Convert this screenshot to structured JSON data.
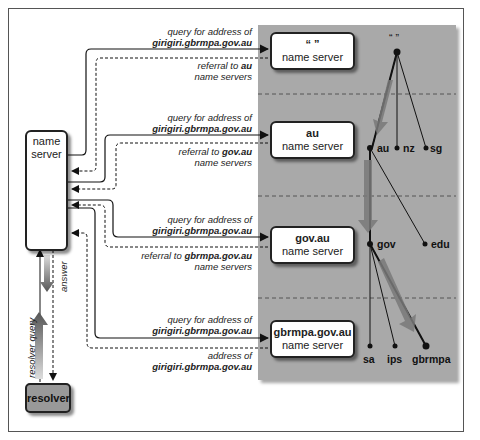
{
  "diagram": {
    "local_server": {
      "line1": "name",
      "line2": "server"
    },
    "resolver": {
      "label": "resolver"
    },
    "vertical_labels": {
      "answer": "answer",
      "resolver_query": "resolver query"
    },
    "servers": [
      {
        "name": "“ ”",
        "sub": "name server"
      },
      {
        "name": "au",
        "sub": "name server"
      },
      {
        "name": "gov.au",
        "sub": "name server"
      },
      {
        "name": "gbrmpa.gov.au",
        "sub": "name server"
      }
    ],
    "exchanges": [
      {
        "query_prefix": "query for address of",
        "query_target": "girigiri.gbrmpa.gov.au",
        "reply_prefix": "referral to",
        "reply_target": "au",
        "reply_suffix": "name servers"
      },
      {
        "query_prefix": "query for address of",
        "query_target": "girigiri.gbrmpa.gov.au",
        "reply_prefix": "referral to",
        "reply_target": "gov.au",
        "reply_suffix": "name servers"
      },
      {
        "query_prefix": "query for address of",
        "query_target": "girigiri.gbrmpa.gov.au",
        "reply_prefix": "referral to",
        "reply_target": "gbrmpa.gov.au",
        "reply_suffix": "name servers"
      },
      {
        "query_prefix": "query for address of",
        "query_target": "girigiri.gbrmpa.gov.au",
        "reply_prefix": "address of",
        "reply_target": "girigiri.gbrmpa.gov.au",
        "reply_suffix": ""
      }
    ],
    "tree": {
      "root": "“ ”",
      "level1": [
        "au",
        "nz",
        "sg"
      ],
      "level2": [
        "gov",
        "edu"
      ],
      "level3": [
        "sa",
        "ips",
        "gbrmpa"
      ]
    },
    "colors": {
      "panel": "#a9a9a9",
      "resolver": "#999999",
      "border": "#222222"
    }
  }
}
